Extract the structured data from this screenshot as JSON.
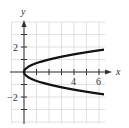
{
  "chart_data": {
    "type": "line",
    "title": "",
    "xlabel": "x",
    "ylabel": "y",
    "equation": "x = 2y^2",
    "xlim": [
      -1,
      6.5
    ],
    "ylim": [
      -4,
      4
    ],
    "grid": true,
    "x_ticks": [
      1,
      2,
      3,
      4,
      5,
      6
    ],
    "x_tick_labels": [
      {
        "value": 4,
        "label": "4"
      },
      {
        "value": 6,
        "label": "6"
      }
    ],
    "y_ticks": [
      -3,
      -2,
      -1,
      1,
      2,
      3
    ],
    "y_tick_labels": [
      {
        "value": 2,
        "label": "2"
      },
      {
        "value": -2,
        "label": "-2"
      }
    ],
    "series": [
      {
        "name": "upper branch",
        "x": [
          0,
          0.5,
          1,
          2,
          3,
          4,
          5,
          6,
          6.4
        ],
        "y": [
          0,
          0.5,
          0.71,
          1.0,
          1.22,
          1.41,
          1.58,
          1.73,
          1.79
        ]
      },
      {
        "name": "lower branch",
        "x": [
          0,
          0.5,
          1,
          2,
          3,
          4,
          5,
          6,
          6.4
        ],
        "y": [
          0,
          -0.5,
          -0.71,
          -1.0,
          -1.22,
          -1.41,
          -1.58,
          -1.73,
          -1.79
        ]
      }
    ]
  },
  "labels": {
    "x_axis": "x",
    "y_axis": "y",
    "x4": "4",
    "x6": "6",
    "y2": "2",
    "ym2": "−2"
  }
}
